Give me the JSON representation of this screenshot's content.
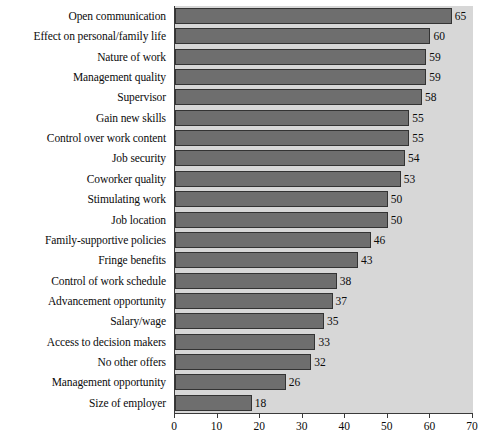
{
  "chart_data": {
    "type": "bar",
    "orientation": "horizontal",
    "title": "",
    "subtitle": "",
    "xlabel": "",
    "ylabel": "",
    "xlim": [
      0,
      70
    ],
    "xticks": [
      0,
      10,
      20,
      30,
      40,
      50,
      60,
      70
    ],
    "grid": false,
    "legend": false,
    "legend_position": "none",
    "bar_color": "#6e6e6e",
    "bar_edge_color": "#333333",
    "plot_background": "#d7d7d7",
    "figure_background": "#ffffff",
    "categories": [
      "Open communication",
      "Effect on personal/family life",
      "Nature of work",
      "Management quality",
      "Supervisor",
      "Gain new skills",
      "Control over work content",
      "Job security",
      "Coworker quality",
      "Stimulating work",
      "Job location",
      "Family-supportive policies",
      "Fringe benefits",
      "Control of work schedule",
      "Advancement opportunity",
      "Salary/wage",
      "Access to decision makers",
      "No other offers",
      "Management opportunity",
      "Size of employer"
    ],
    "values": [
      65,
      60,
      59,
      59,
      58,
      55,
      55,
      54,
      53,
      50,
      50,
      46,
      43,
      38,
      37,
      35,
      33,
      32,
      26,
      18
    ],
    "data_labels": [
      "65",
      "60",
      "59",
      "59",
      "58",
      "55",
      "55",
      "54",
      "53",
      "50",
      "50",
      "46",
      "43",
      "38",
      "37",
      "35",
      "33",
      "32",
      "26",
      "18"
    ],
    "xtick_labels": [
      "0",
      "10",
      "20",
      "30",
      "40",
      "50",
      "60",
      "70"
    ]
  }
}
